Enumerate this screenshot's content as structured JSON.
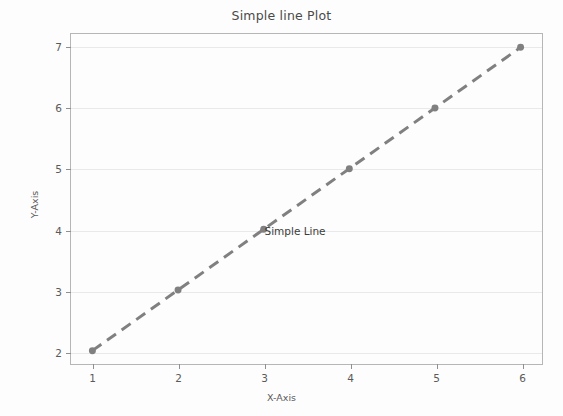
{
  "chart_data": {
    "type": "line",
    "title": "Simple line Plot",
    "xlabel": "X-Axis",
    "ylabel": "Y-Axis",
    "x": [
      1,
      2,
      3,
      4,
      5,
      6
    ],
    "series": [
      {
        "name": "Simple Line",
        "values": [
          2,
          3,
          4,
          5,
          6,
          7
        ],
        "color": "#808080",
        "linestyle": "dashed",
        "linewidth": 3,
        "marker": "circle",
        "markersize": 7
      }
    ],
    "xlim": [
      0.75,
      6.25
    ],
    "ylim": [
      1.78,
      7.22
    ],
    "xticks": [
      1,
      2,
      3,
      4,
      5,
      6
    ],
    "xticklabels": [
      "1",
      "2",
      "3",
      "4",
      "5",
      "6"
    ],
    "yticks": [
      2,
      3,
      4,
      5,
      6,
      7
    ],
    "yticklabels": [
      "2",
      "3",
      "4",
      "5",
      "6",
      "7"
    ],
    "grid": {
      "horizontal": true,
      "vertical": false,
      "color": "#e9e9ec"
    },
    "annotations": [
      {
        "text": "Simple Line",
        "x": 3,
        "y": 4
      }
    ],
    "legend": null,
    "background_color": "#fdfdfd",
    "frame_color": "#b6b6b6"
  }
}
